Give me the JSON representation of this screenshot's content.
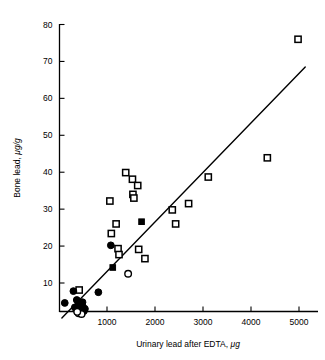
{
  "chart_data": {
    "type": "scatter",
    "title": "",
    "xlabel": "Urinary lead after EDTA, μg",
    "ylabel": "Bone lead, μg/g",
    "xlim": [
      0,
      5300
    ],
    "ylim": [
      0,
      82
    ],
    "xticks": [
      1000,
      2000,
      3000,
      4000,
      5000
    ],
    "xtick_labels": [
      "1000",
      "2000",
      "3000",
      "4000",
      "5000"
    ],
    "yticks": [
      10,
      20,
      30,
      40,
      50,
      60,
      70,
      80
    ],
    "ytick_labels": [
      "10",
      "20",
      "30",
      "40",
      "50",
      "60",
      "70",
      "80"
    ],
    "grid": false,
    "legend": false,
    "marker_colors": {
      "open_square": "#ffffff",
      "filled_square": "#000000",
      "filled_circle": "#000000",
      "open_circle": "#ffffff",
      "outline": "#000000",
      "line": "#000000"
    },
    "trend_line": {
      "label": "regression line",
      "x_start": 60,
      "y_start": 0.5,
      "x_end": 5130,
      "y_end": 68.5
    },
    "series": [
      {
        "name": "open-square",
        "marker": "open_square",
        "points": [
          [
            1060,
            32.2
          ],
          [
            1090,
            23.4
          ],
          [
            1190,
            26.0
          ],
          [
            1230,
            19.3
          ],
          [
            1250,
            17.7
          ],
          [
            1390,
            39.9
          ],
          [
            1530,
            38.1
          ],
          [
            1540,
            34.0
          ],
          [
            1560,
            33.0
          ],
          [
            1640,
            36.4
          ],
          [
            1660,
            19.1
          ],
          [
            1790,
            16.6
          ],
          [
            2360,
            29.8
          ],
          [
            2430,
            26.0
          ],
          [
            2700,
            31.5
          ],
          [
            3110,
            38.7
          ],
          [
            4340,
            43.9
          ],
          [
            4980,
            76.0
          ],
          [
            420,
            8.1
          ]
        ]
      },
      {
        "name": "filled-square",
        "marker": "filled_square",
        "points": [
          [
            1120,
            14.2
          ],
          [
            1720,
            26.6
          ]
        ]
      },
      {
        "name": "filled-circle",
        "marker": "filled_circle",
        "points": [
          [
            1080,
            20.2
          ],
          [
            820,
            7.5
          ],
          [
            300,
            7.8
          ],
          [
            120,
            4.6
          ],
          [
            370,
            5.4
          ],
          [
            400,
            4.0
          ],
          [
            430,
            4.4
          ],
          [
            450,
            3.2
          ],
          [
            470,
            2.6
          ],
          [
            490,
            4.8
          ],
          [
            500,
            3.5
          ],
          [
            520,
            2.4
          ],
          [
            540,
            3.0
          ],
          [
            360,
            2.8
          ],
          [
            330,
            3.4
          ]
        ]
      },
      {
        "name": "open-circle",
        "marker": "open_circle",
        "points": [
          [
            1440,
            12.5
          ],
          [
            410,
            1.8
          ],
          [
            470,
            1.6
          ],
          [
            380,
            2.2
          ]
        ]
      }
    ]
  }
}
